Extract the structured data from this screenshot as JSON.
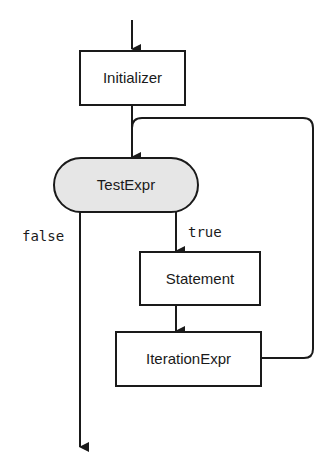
{
  "diagram": {
    "type": "flowchart",
    "title": "",
    "colors": {
      "stroke": "#1a1a1a",
      "box_fill": "#ffffff",
      "decision_fill": "#e6e6e6"
    },
    "nodes": [
      {
        "id": "initializer",
        "label": "Initializer",
        "shape": "rectangle"
      },
      {
        "id": "testexpr",
        "label": "TestExpr",
        "shape": "pill"
      },
      {
        "id": "statement",
        "label": "Statement",
        "shape": "rectangle"
      },
      {
        "id": "iterationexpr",
        "label": "IterationExpr",
        "shape": "rectangle"
      }
    ],
    "edges": [
      {
        "from": "entry",
        "to": "initializer",
        "label": ""
      },
      {
        "from": "initializer",
        "to": "testexpr",
        "label": ""
      },
      {
        "from": "testexpr",
        "to": "statement",
        "label": "true"
      },
      {
        "from": "statement",
        "to": "iterationexpr",
        "label": ""
      },
      {
        "from": "iterationexpr",
        "to": "testexpr",
        "label": ""
      },
      {
        "from": "testexpr",
        "to": "exit",
        "label": "false"
      }
    ]
  }
}
